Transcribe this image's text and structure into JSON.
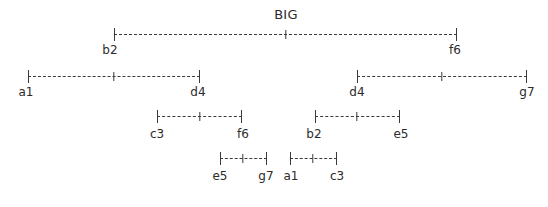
{
  "diagram": {
    "type": "hierarchical-bracket-tree",
    "title": "BIG",
    "title_x": 286,
    "title_y": 8,
    "background_color": "#ffffff",
    "line_color": "#3a3a3a",
    "text_color": "#2b2b2b",
    "brackets": [
      {
        "id": "level1-root",
        "x1": 114,
        "x2": 457,
        "y": 28,
        "plus_x": 286
      },
      {
        "id": "level2-left",
        "x1": 28,
        "x2": 200,
        "y": 70,
        "plus_x": 114
      },
      {
        "id": "level2-right",
        "x1": 357,
        "x2": 527,
        "y": 70,
        "plus_x": 442
      },
      {
        "id": "level3-left",
        "x1": 157,
        "x2": 242,
        "y": 110,
        "plus_x": 200
      },
      {
        "id": "level3-right",
        "x1": 315,
        "x2": 400,
        "y": 110,
        "plus_x": 357
      },
      {
        "id": "level4-left",
        "x1": 220,
        "x2": 267,
        "y": 152,
        "plus_x": 243
      },
      {
        "id": "level4-right",
        "x1": 290,
        "x2": 337,
        "y": 152,
        "plus_x": 313
      }
    ],
    "labels": [
      {
        "id": "label-b2-l1",
        "text": "b2",
        "x": 110,
        "y": 44
      },
      {
        "id": "label-f6-l1",
        "text": "f6",
        "x": 455,
        "y": 44
      },
      {
        "id": "label-a1-l2",
        "text": "a1",
        "x": 26,
        "y": 86
      },
      {
        "id": "label-d4-l2-left",
        "text": "d4",
        "x": 198,
        "y": 86
      },
      {
        "id": "label-d4-l2-right",
        "text": "d4",
        "x": 357,
        "y": 86
      },
      {
        "id": "label-g7-l2",
        "text": "g7",
        "x": 527,
        "y": 86
      },
      {
        "id": "label-c3-l3",
        "text": "c3",
        "x": 157,
        "y": 128
      },
      {
        "id": "label-f6-l3",
        "text": "f6",
        "x": 243,
        "y": 128
      },
      {
        "id": "label-b2-l3",
        "text": "b2",
        "x": 314,
        "y": 128
      },
      {
        "id": "label-e5-l3",
        "text": "e5",
        "x": 401,
        "y": 128
      },
      {
        "id": "label-e5-l4",
        "text": "e5",
        "x": 220,
        "y": 170
      },
      {
        "id": "label-g7-l4",
        "text": "g7",
        "x": 266,
        "y": 170
      },
      {
        "id": "label-a1-l4",
        "text": "a1",
        "x": 291,
        "y": 170
      },
      {
        "id": "label-c3-l4",
        "text": "c3",
        "x": 337,
        "y": 170
      }
    ]
  }
}
